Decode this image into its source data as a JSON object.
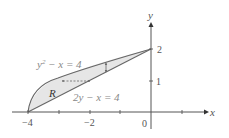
{
  "diagram": {
    "axes": {
      "x_label": "x",
      "y_label": "y",
      "x_ticks": [
        {
          "value": -4,
          "label": "−4"
        },
        {
          "value": -3,
          "label": ""
        },
        {
          "value": -2,
          "label": "−2"
        },
        {
          "value": -1,
          "label": ""
        },
        {
          "value": 0,
          "label": "0"
        },
        {
          "value": 1,
          "label": ""
        }
      ],
      "y_ticks": [
        {
          "value": 1,
          "label": "1"
        },
        {
          "value": 2,
          "label": "2"
        }
      ]
    },
    "curves": {
      "parabola_label": "y² − x = 4",
      "parabola_eq_base": "y",
      "parabola_eq_sup": "2",
      "parabola_eq_rest": " − x = 4",
      "line_label": "2y − x = 4"
    },
    "region_label": "R",
    "colors": {
      "region_fill": "#e6e6e6",
      "curve_stroke": "#666666",
      "axis_stroke": "#555555",
      "label_color": "#888888"
    }
  }
}
